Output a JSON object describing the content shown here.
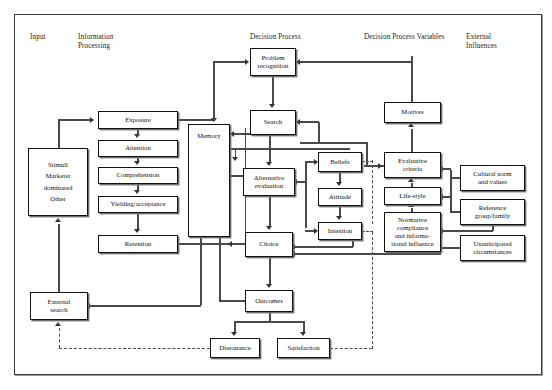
{
  "diagram": {
    "frame": {
      "border_color": "#3a3a3a"
    },
    "column_headers": [
      {
        "id": "input",
        "label": "Input",
        "x": 30,
        "y": 33
      },
      {
        "id": "information-processing",
        "label": "Information\nProcessing",
        "x": 78,
        "y": 33
      },
      {
        "id": "decision-process",
        "label": "Decision Process",
        "x": 250,
        "y": 33
      },
      {
        "id": "decision-process-variables",
        "label": "Decision Process Variables",
        "x": 364,
        "y": 33
      },
      {
        "id": "external-influences",
        "label": "External\nInfluences",
        "x": 466,
        "y": 33
      }
    ],
    "nodes": [
      {
        "id": "stimuli",
        "lines": [
          "Stimuli",
          "Marketer",
          "dominated",
          "Other"
        ],
        "x": 28,
        "y": 148,
        "w": 60,
        "h": 68,
        "multi": true
      },
      {
        "id": "external-search",
        "lines": [
          "External",
          "search"
        ],
        "x": 30,
        "y": 292,
        "w": 58,
        "h": 28,
        "multi": true
      },
      {
        "id": "exposure",
        "lines": [
          "Exposure"
        ],
        "x": 98,
        "y": 111,
        "w": 80,
        "h": 18
      },
      {
        "id": "attention",
        "lines": [
          "Attention"
        ],
        "x": 98,
        "y": 140,
        "w": 80,
        "h": 17
      },
      {
        "id": "comprehension",
        "lines": [
          "Comprehension"
        ],
        "x": 98,
        "y": 167,
        "w": 80,
        "h": 17
      },
      {
        "id": "yielding-acceptance",
        "lines": [
          "Yielding/acceptance"
        ],
        "x": 98,
        "y": 196,
        "w": 80,
        "h": 17
      },
      {
        "id": "retention",
        "lines": [
          "Retention"
        ],
        "x": 98,
        "y": 235,
        "w": 80,
        "h": 18
      },
      {
        "id": "memory",
        "lines": [
          "Memory"
        ],
        "x": 188,
        "y": 124,
        "w": 42,
        "h": 113
      },
      {
        "id": "problem-recognition",
        "lines": [
          "Problem",
          "recognition"
        ],
        "x": 250,
        "y": 48,
        "w": 46,
        "h": 28,
        "multi": true
      },
      {
        "id": "search",
        "lines": [
          "Search"
        ],
        "x": 250,
        "y": 110,
        "w": 46,
        "h": 25
      },
      {
        "id": "alternative-evaluation",
        "lines": [
          "Alternative",
          "evaluation"
        ],
        "x": 243,
        "y": 168,
        "w": 52,
        "h": 28,
        "multi": true
      },
      {
        "id": "choice",
        "lines": [
          "Choice"
        ],
        "x": 245,
        "y": 232,
        "w": 48,
        "h": 25
      },
      {
        "id": "outcomes",
        "lines": [
          "Outcomes"
        ],
        "x": 245,
        "y": 290,
        "w": 48,
        "h": 22
      },
      {
        "id": "dissonance",
        "lines": [
          "Dissonance"
        ],
        "x": 210,
        "y": 338,
        "w": 50,
        "h": 20
      },
      {
        "id": "satisfaction",
        "lines": [
          "Satisfaction"
        ],
        "x": 277,
        "y": 338,
        "w": 53,
        "h": 20
      },
      {
        "id": "beliefs",
        "lines": [
          "Beliefs"
        ],
        "x": 318,
        "y": 152,
        "w": 44,
        "h": 20
      },
      {
        "id": "attitude",
        "lines": [
          "Attitude"
        ],
        "x": 318,
        "y": 188,
        "w": 44,
        "h": 18
      },
      {
        "id": "intention",
        "lines": [
          "Intention"
        ],
        "x": 318,
        "y": 222,
        "w": 44,
        "h": 18
      },
      {
        "id": "motives",
        "lines": [
          "Motives"
        ],
        "x": 384,
        "y": 102,
        "w": 57,
        "h": 21
      },
      {
        "id": "evaluative-criteria",
        "lines": [
          "Evaluative",
          "criteria"
        ],
        "x": 384,
        "y": 152,
        "w": 57,
        "h": 26,
        "multi": true
      },
      {
        "id": "life-style",
        "lines": [
          "Life-style"
        ],
        "x": 384,
        "y": 187,
        "w": 57,
        "h": 18
      },
      {
        "id": "normative-compliance",
        "lines": [
          "Normative",
          "compliance",
          "and informa-",
          "tional influence"
        ],
        "x": 384,
        "y": 212,
        "w": 57,
        "h": 40,
        "multi": true
      },
      {
        "id": "cultural-norm-and-values",
        "lines": [
          "Cultural norm",
          "and values"
        ],
        "x": 460,
        "y": 165,
        "w": 65,
        "h": 26,
        "multi": true
      },
      {
        "id": "reference-group-family",
        "lines": [
          "Reference",
          "group/family"
        ],
        "x": 460,
        "y": 199,
        "w": 65,
        "h": 26,
        "multi": true
      },
      {
        "id": "unanticipated-circumstances",
        "lines": [
          "Unanticipated",
          "circumstances"
        ],
        "x": 460,
        "y": 235,
        "w": 65,
        "h": 26,
        "multi": true
      }
    ]
  }
}
